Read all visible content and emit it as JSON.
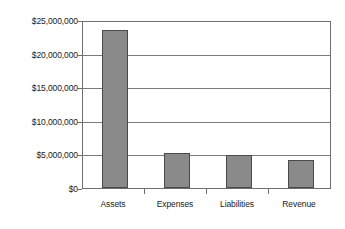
{
  "chart_data": {
    "type": "bar",
    "title": "",
    "xlabel": "",
    "ylabel": "",
    "categories": [
      "Assets",
      "Expenses",
      "Liabilities",
      "Revenue"
    ],
    "values": [
      23800000,
      5200000,
      4950000,
      4200000
    ],
    "ylim": [
      0,
      25000000
    ],
    "ytick_values": [
      0,
      5000000,
      10000000,
      15000000,
      20000000,
      25000000
    ],
    "ytick_labels": [
      "$0",
      "$5,000,000",
      "$10,000,000",
      "$15,000,000",
      "$20,000,000",
      "$25,000,000"
    ],
    "grid": true,
    "legend": false,
    "bar_color": "#8a8a8a",
    "bar_edge_color": "#4a4a4a",
    "axis_color": "#6f6f6f",
    "plot_background": "#ffffff"
  }
}
